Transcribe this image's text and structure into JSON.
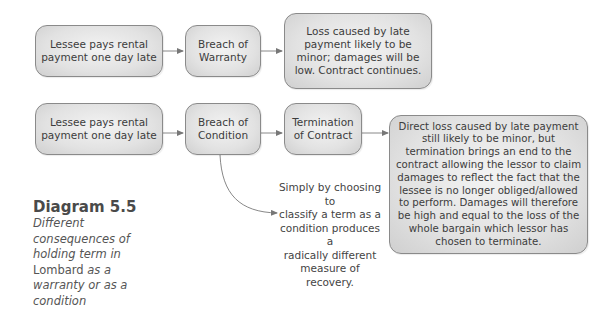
{
  "diagram": {
    "row1": {
      "cause": "Lessee pays rental\npayment one day late",
      "breach": "Breach of\nWarranty",
      "outcome": "Loss caused by late\npayment likely to be\nminor; damages will be\nlow.  Contract continues."
    },
    "row2": {
      "cause": "Lessee pays rental\npayment one day late",
      "breach": "Breach of\nCondition",
      "termination": "Termination\nof Contract",
      "outcome": "Direct loss caused by late payment\nstill likely to be minor, but\ntermination brings an end to the\ncontract allowing the lessor to claim\ndamages to reflect the fact that the\nlessee is no longer obliged/allowed\nto perform.  Damages will therefore\nbe high and equal to the loss of the\nwhole bargain which lessor has\nchosen to terminate."
    },
    "annotation": "Simply by choosing to\nclassify a term as a\ncondition produces a\nradically different\nmeasure of recovery."
  },
  "caption": {
    "title": "Diagram 5.5",
    "line1": "Different",
    "line2": "consequences of",
    "line3": "holding term in",
    "case_name": "Lombard",
    "line4_rest": " as a",
    "line5": "warranty or as a",
    "line6": "condition"
  },
  "colors": {
    "box_fill": "#e2e2e2",
    "box_border": "#8a8a8a",
    "arrow": "#777777"
  }
}
